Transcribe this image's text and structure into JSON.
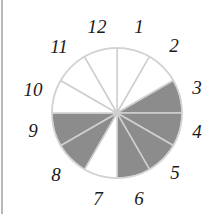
{
  "diagram": {
    "type": "fraction-circle-clock",
    "center": [
      117,
      113
    ],
    "radius": 65,
    "sector_count": 12,
    "colors": {
      "shaded": "#8c8c8c",
      "unshaded": "#ffffff",
      "divider": "#cfcfcf",
      "outline": "#d4d4d4"
    },
    "sectors": [
      {
        "from": "12",
        "to": "1",
        "shaded": false
      },
      {
        "from": "1",
        "to": "2",
        "shaded": false
      },
      {
        "from": "2",
        "to": "3",
        "shaded": true
      },
      {
        "from": "3",
        "to": "4",
        "shaded": true
      },
      {
        "from": "4",
        "to": "5",
        "shaded": true
      },
      {
        "from": "5",
        "to": "6",
        "shaded": true
      },
      {
        "from": "6",
        "to": "7",
        "shaded": false
      },
      {
        "from": "7",
        "to": "8",
        "shaded": true
      },
      {
        "from": "8",
        "to": "9",
        "shaded": true
      },
      {
        "from": "9",
        "to": "10",
        "shaded": false
      },
      {
        "from": "10",
        "to": "11",
        "shaded": false
      },
      {
        "from": "11",
        "to": "12",
        "shaded": false
      }
    ],
    "shaded_fraction": "6/12",
    "labels": [
      {
        "text": "12",
        "x": 97,
        "y": 33
      },
      {
        "text": "1",
        "x": 139,
        "y": 33
      },
      {
        "text": "2",
        "x": 174,
        "y": 52
      },
      {
        "text": "3",
        "x": 197,
        "y": 94
      },
      {
        "text": "4",
        "x": 197,
        "y": 138
      },
      {
        "text": "5",
        "x": 175,
        "y": 179
      },
      {
        "text": "6",
        "x": 139,
        "y": 205
      },
      {
        "text": "7",
        "x": 98,
        "y": 205
      },
      {
        "text": "8",
        "x": 56,
        "y": 181
      },
      {
        "text": "9",
        "x": 33,
        "y": 137
      },
      {
        "text": "10",
        "x": 33,
        "y": 96
      },
      {
        "text": "11",
        "x": 59,
        "y": 53
      }
    ]
  }
}
